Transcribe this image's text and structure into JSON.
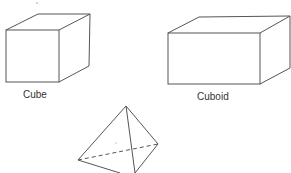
{
  "figure": {
    "shapes": [
      {
        "name": "cube",
        "label": "Cube"
      },
      {
        "name": "cuboid",
        "label": "Cuboid"
      },
      {
        "name": "pyramid",
        "label": ""
      }
    ],
    "stroke_color": "#555555",
    "background": "#ffffff"
  }
}
